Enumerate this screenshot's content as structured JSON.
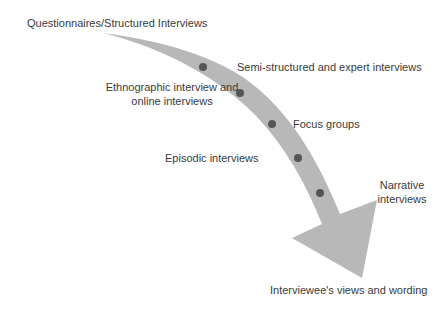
{
  "diagram": {
    "start_label": "Questionnaires/Structured Interviews",
    "end_label": "Interviewee's views and wording",
    "arrow_color": "#b8b8b8",
    "dot_color": "#555555",
    "stages": [
      {
        "label": "Semi-structured and expert interviews",
        "side": "right"
      },
      {
        "label_line1": "Ethnographic interview and",
        "label_line2": "online interviews",
        "side": "left"
      },
      {
        "label": "Focus groups",
        "side": "right"
      },
      {
        "label": "Episodic interviews",
        "side": "left"
      },
      {
        "label_line1": "Narrative",
        "label_line2": "interviews",
        "side": "right"
      }
    ]
  }
}
